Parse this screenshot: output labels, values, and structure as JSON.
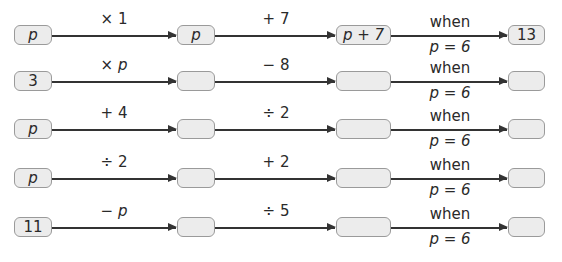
{
  "rows": [
    {
      "start": "p",
      "op1": "× 1",
      "mid": "p",
      "op2": "+ 7",
      "expr": "p + 7",
      "when": "when",
      "cond": "p = 6",
      "result": "13",
      "start_italic": true,
      "mid_italic": true
    },
    {
      "start": "3",
      "op1": "× p",
      "mid": "",
      "op2": "− 8",
      "expr": "",
      "when": "when",
      "cond": "p = 6",
      "result": "",
      "start_italic": false,
      "mid_italic": false
    },
    {
      "start": "p",
      "op1": "+ 4",
      "mid": "",
      "op2": "÷ 2",
      "expr": "",
      "when": "when",
      "cond": "p = 6",
      "result": "",
      "start_italic": true,
      "mid_italic": false
    },
    {
      "start": "p",
      "op1": "÷ 2",
      "mid": "",
      "op2": "+ 2",
      "expr": "",
      "when": "when",
      "cond": "p = 6",
      "result": "",
      "start_italic": true,
      "mid_italic": false
    },
    {
      "start": "11",
      "op1": "− p",
      "mid": "",
      "op2": "÷ 5",
      "expr": "",
      "when": "when",
      "cond": "p = 6",
      "result": "",
      "start_italic": false,
      "mid_italic": false
    }
  ],
  "colors": {
    "box_fill": "#ececec",
    "box_border": "#9a9a9a",
    "line": "#333333"
  }
}
